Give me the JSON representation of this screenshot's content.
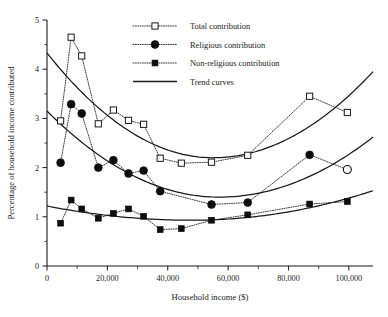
{
  "chart_data": {
    "type": "scatter",
    "title": "",
    "xlabel": "Household income ($)",
    "ylabel": "Percentage of household income contributed",
    "xlim": [
      0,
      108000
    ],
    "ylim": [
      0,
      5
    ],
    "grid": false,
    "legend_position": "top-center",
    "x_ticks_major": [
      0,
      20000,
      40000,
      60000,
      80000,
      100000
    ],
    "x_tick_labels": [
      "0",
      "20,000",
      "40,000",
      "60,000",
      "80,000",
      "100,000"
    ],
    "x_ticks_minor": [
      10000,
      30000,
      50000,
      70000,
      90000
    ],
    "y_ticks_major": [
      0,
      1,
      2,
      3,
      4,
      5
    ],
    "y_tick_labels": [
      "0",
      "1",
      "2",
      "3",
      "4",
      "5"
    ],
    "y_ticks_minor": [
      0.5,
      1.5,
      2.5,
      3.5,
      4.5
    ],
    "series": [
      {
        "name": "Total contribution",
        "marker": "open-square",
        "line": "dotted",
        "x": [
          4500,
          8000,
          11500,
          17000,
          22000,
          27000,
          32000,
          37500,
          44500,
          54500,
          66500,
          87000,
          99500
        ],
        "y": [
          2.95,
          4.65,
          4.27,
          2.89,
          3.17,
          2.96,
          2.88,
          2.19,
          2.09,
          2.11,
          2.25,
          3.45,
          3.12
        ]
      },
      {
        "name": "Religious contribution",
        "marker": "filled-circle",
        "line": "dotted",
        "x": [
          4500,
          8000,
          11500,
          17000,
          22000,
          27000,
          32000,
          37500,
          54500,
          66500,
          87000,
          99500
        ],
        "y": [
          2.1,
          3.29,
          3.1,
          2.0,
          2.15,
          1.88,
          1.94,
          1.52,
          1.25,
          1.29,
          2.26,
          1.96
        ],
        "last_point_marker": "open-circle"
      },
      {
        "name": "Non-religious contribution",
        "marker": "filled-square",
        "line": "dotted",
        "x": [
          4500,
          8000,
          11500,
          17000,
          22000,
          27000,
          32000,
          37500,
          44500,
          54500,
          66500,
          87000,
          99500
        ],
        "y": [
          0.87,
          1.34,
          1.16,
          0.97,
          1.07,
          1.16,
          1.01,
          0.74,
          0.76,
          0.93,
          1.04,
          1.26,
          1.31
        ]
      }
    ],
    "trend_curves": [
      {
        "name": "Total contribution trend",
        "type": "quadratic",
        "x_start": 0,
        "x_end": 108000,
        "y_start": 4.33,
        "y_min": 2.2,
        "x_min": 55000,
        "y_end": 3.95
      },
      {
        "name": "Religious contribution trend",
        "type": "quadratic",
        "x_start": 0,
        "x_end": 108000,
        "y_start": 3.15,
        "y_min": 1.4,
        "x_min": 57000,
        "y_end": 2.62
      },
      {
        "name": "Non-religious contribution trend",
        "type": "quadratic",
        "x_start": 0,
        "x_end": 108000,
        "y_start": 1.22,
        "y_min": 0.93,
        "x_min": 48000,
        "y_end": 1.53
      }
    ]
  },
  "legend": {
    "entries": [
      {
        "label": "Total contribution",
        "marker": "open-square",
        "style": "dotted"
      },
      {
        "label": "Religious contribution",
        "marker": "filled-circle",
        "style": "dotted"
      },
      {
        "label": "Non-religious contribution",
        "marker": "filled-square",
        "style": "dotted"
      },
      {
        "label": "Trend curves",
        "marker": "none",
        "style": "solid"
      }
    ]
  },
  "axes": {
    "x_title": "Household income ($)",
    "y_title": "Percentage of household income contributed"
  }
}
